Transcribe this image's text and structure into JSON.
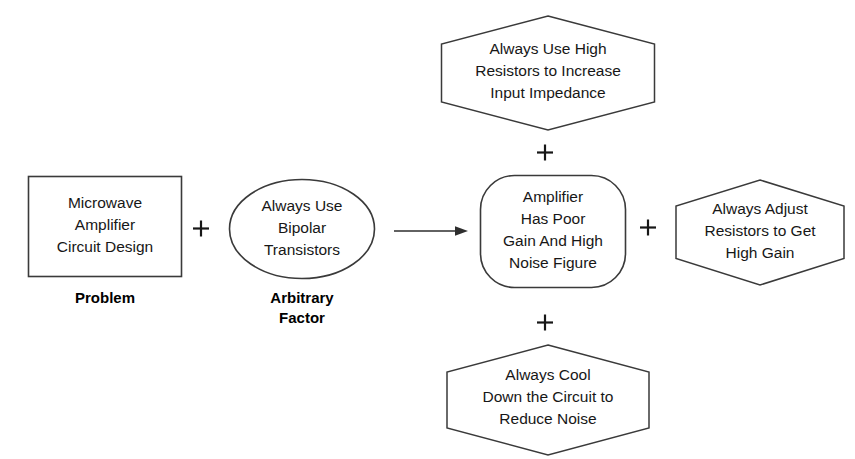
{
  "diagram": {
    "type": "cause-and-effect / arbitrary-factor flow diagram",
    "background_color": "#ffffff",
    "stroke_color": "#3a3a3a",
    "text_color": "#171717",
    "nodes": {
      "problem": {
        "shape": "rectangle",
        "text": "Microwave\nAmplifier\nCircuit Design",
        "caption": "Problem"
      },
      "arbitrary_factor": {
        "shape": "ellipse",
        "text": "Always Use\nBipolar\nTransistors",
        "caption": "Arbitrary\nFactor"
      },
      "result": {
        "shape": "rounded-rectangle",
        "text": "Amplifier\nHas Poor\nGain And High\nNoise Figure"
      },
      "top_hexagon": {
        "shape": "hexagon",
        "text": "Always Use High\nResistors to Increase\nInput Impedance"
      },
      "right_hexagon": {
        "shape": "hexagon",
        "text": "Always Adjust\nResistors to Get\nHigh Gain"
      },
      "bottom_hexagon": {
        "shape": "hexagon",
        "text": "Always Cool\nDown the Circuit to\nReduce Noise"
      }
    },
    "operators": {
      "plus_problem_factor": "+",
      "plus_top": "+",
      "plus_right": "+",
      "plus_bottom": "+"
    },
    "connectors": {
      "arrow_factor_to_result": "arrow-right"
    }
  }
}
